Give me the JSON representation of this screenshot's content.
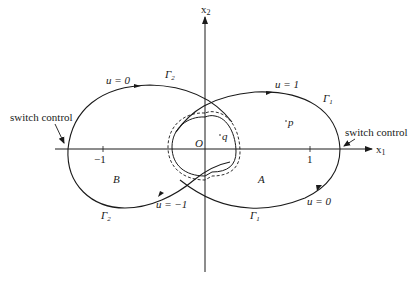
{
  "axes": {
    "x_label": "x",
    "x_sub": "1",
    "y_label": "x",
    "y_sub": "2",
    "origin_label": "O",
    "ticks": [
      {
        "value": "−1"
      },
      {
        "value": "1"
      }
    ]
  },
  "curves": {
    "gamma2": {
      "symbol": "Γ",
      "sub": "2"
    },
    "gamma1": {
      "symbol": "Γ",
      "sub": "1"
    }
  },
  "annotations": {
    "u0_top": "u = 0",
    "u1_top": "u = 1",
    "um1_bottom": "u = −1",
    "u0_bottom": "u = 0",
    "switch_left": "switch control",
    "switch_right": "switch control",
    "region_A": "A",
    "region_B": "B",
    "point_p": "p",
    "point_q": "q"
  },
  "colors": {
    "ink": "#1a1a1a",
    "background": "#ffffff"
  }
}
